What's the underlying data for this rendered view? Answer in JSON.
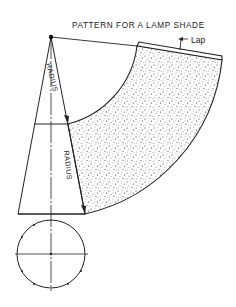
{
  "diagram": {
    "title": "PATTERN FOR A LAMP SHADE",
    "labels": {
      "lap": "Lap",
      "radius_upper": "RADIUS",
      "radius_lower": "RADIUS"
    },
    "colors": {
      "line": "#222222",
      "stipple": "#333333",
      "background": "#ffffff"
    },
    "elements": [
      "cone-elevation",
      "frustum-top-line",
      "frustum-base-line",
      "center-axis",
      "plan-view-circle",
      "developed-pattern-stippled-annulus-sector",
      "lap-strip",
      "radius-arrows"
    ]
  }
}
